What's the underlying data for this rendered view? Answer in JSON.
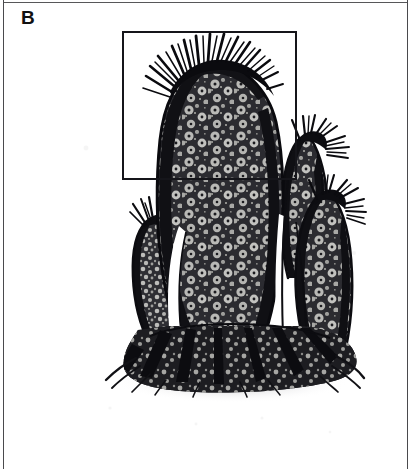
{
  "figure": {
    "panel_label": "B",
    "caption_visible": false,
    "background_color": "#ffffff",
    "ink_color": "#101014",
    "border_color": "#4a4a4d"
  },
  "inset": {
    "name": "inset-selection-rectangle",
    "stroke_color": "#15151a",
    "stroke_width_px": 2,
    "x": 122,
    "y": 31,
    "width": 175,
    "height": 149
  },
  "illustration": {
    "name": "tube-sponge-cluster-illustration",
    "subject": "cluster of four club-shaped tube sponges with bristle crowns on a shared basal holdfast",
    "style": "black-and-white stippled scientific line drawing",
    "elements": [
      {
        "id": "main-tube",
        "label": "central large tube",
        "has_bristle_crown": true,
        "bristle_direction": "up-and-left",
        "texture": "ringed ostia on mottled ground"
      },
      {
        "id": "left-small-tube",
        "label": "left short tube",
        "has_bristle_crown": true,
        "bristle_direction": "up",
        "texture": "fine stipple"
      },
      {
        "id": "right-upper-tube",
        "label": "right upper tube",
        "has_bristle_crown": true,
        "bristle_direction": "up-and-right",
        "texture": "ringed ostia"
      },
      {
        "id": "right-lower-tube",
        "label": "right lower tube",
        "has_bristle_crown": true,
        "bristle_direction": "right",
        "texture": "ringed ostia"
      },
      {
        "id": "basal-holdfast",
        "label": "root-like basal attachment with cast shadow",
        "has_bristle_crown": false,
        "texture": "dark splaying rootlets"
      }
    ]
  }
}
